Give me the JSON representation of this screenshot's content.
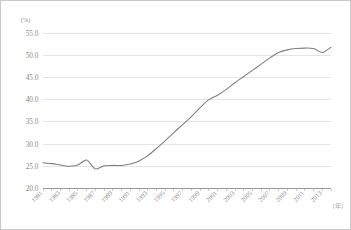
{
  "chart_data": {
    "type": "line",
    "title": "",
    "subtitle": "",
    "xlabel": "(年)",
    "ylabel": "(%)",
    "y_unit_label": "(%)",
    "x_unit_label": "(年)",
    "grid": true,
    "legend": false,
    "legend_position": "none",
    "line_color": "#7d7d7d",
    "grid_color": "#d9d9d9",
    "axis_color": "#9a9a9a",
    "text_color": "#8a8a8a",
    "ylim": [
      20.0,
      55.0
    ],
    "ytick_step": 5.0,
    "ytick_labels": [
      "55.0",
      "50.0",
      "45.0",
      "40.0",
      "35.0",
      "30.0",
      "25.0",
      "20.0"
    ],
    "ytick_values": [
      55.0,
      50.0,
      45.0,
      40.0,
      35.0,
      30.0,
      25.0,
      20.0
    ],
    "xlim": [
      1981,
      2014
    ],
    "xtick_label_step": 2,
    "xtick_labels": [
      "1981",
      "1983",
      "1985",
      "1987",
      "1989",
      "1991",
      "1993",
      "1995",
      "1997",
      "1999",
      "2001",
      "2003",
      "2005",
      "2007",
      "2009",
      "2011",
      "2013"
    ],
    "xtick_values": [
      1981,
      1983,
      1985,
      1987,
      1989,
      1991,
      1993,
      1995,
      1997,
      1999,
      2001,
      2003,
      2005,
      2007,
      2009,
      2011,
      2013
    ],
    "x": [
      1981,
      1982,
      1983,
      1984,
      1985,
      1986,
      1987,
      1988,
      1989,
      1990,
      1991,
      1992,
      1993,
      1994,
      1995,
      1996,
      1997,
      1998,
      1999,
      2000,
      2001,
      2002,
      2003,
      2004,
      2005,
      2006,
      2007,
      2008,
      2009,
      2010,
      2011,
      2012,
      2013,
      2014
    ],
    "values": [
      25.8,
      25.6,
      25.3,
      25.0,
      25.3,
      26.4,
      24.4,
      25.1,
      25.2,
      25.2,
      25.5,
      26.2,
      27.4,
      29.0,
      30.8,
      32.6,
      34.4,
      36.2,
      38.2,
      40.0,
      41.0,
      42.3,
      43.8,
      45.2,
      46.6,
      48.0,
      49.4,
      50.6,
      51.2,
      51.5,
      51.6,
      51.5,
      50.6,
      51.8
    ],
    "series": [
      {
        "name": "",
        "values": [
          25.8,
          25.6,
          25.3,
          25.0,
          25.3,
          26.4,
          24.4,
          25.1,
          25.2,
          25.2,
          25.5,
          26.2,
          27.4,
          29.0,
          30.8,
          32.6,
          34.4,
          36.2,
          38.2,
          40.0,
          41.0,
          42.3,
          43.8,
          45.2,
          46.6,
          48.0,
          49.4,
          50.6,
          51.2,
          51.5,
          51.6,
          51.5,
          50.6,
          51.8
        ]
      }
    ],
    "annotations": []
  }
}
